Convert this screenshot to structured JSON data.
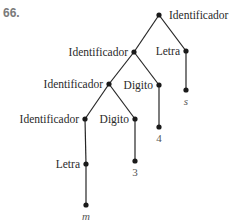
{
  "exercise_number": "66.",
  "tree": {
    "nodes": [
      {
        "id": "n0",
        "label": "Identificador",
        "x": 159,
        "y": 15,
        "label_side": "right"
      },
      {
        "id": "n1",
        "label": "Identificador",
        "x": 134,
        "y": 52,
        "label_side": "left"
      },
      {
        "id": "n2",
        "label": "Letra",
        "x": 186,
        "y": 51,
        "label_side": "left"
      },
      {
        "id": "n3",
        "label": "s",
        "x": 186,
        "y": 90,
        "label_side": "below",
        "leaf": true,
        "italic": true
      },
      {
        "id": "n4",
        "label": "Identificador",
        "x": 109,
        "y": 84,
        "label_side": "left"
      },
      {
        "id": "n5",
        "label": "Digito",
        "x": 159,
        "y": 85,
        "label_side": "left"
      },
      {
        "id": "n6",
        "label": "4",
        "x": 159,
        "y": 127,
        "label_side": "below",
        "leaf": true
      },
      {
        "id": "n7",
        "label": "Identificador",
        "x": 85,
        "y": 119,
        "label_side": "left"
      },
      {
        "id": "n8",
        "label": "Digito",
        "x": 135,
        "y": 119,
        "label_side": "left"
      },
      {
        "id": "n9",
        "label": "3",
        "x": 135,
        "y": 161,
        "label_side": "below",
        "leaf": true
      },
      {
        "id": "n10",
        "label": "Letra",
        "x": 86,
        "y": 164,
        "label_side": "left"
      },
      {
        "id": "n11",
        "label": "m",
        "x": 86,
        "y": 205,
        "label_side": "below",
        "leaf": true,
        "italic": true
      }
    ],
    "edges": [
      [
        "n0",
        "n1"
      ],
      [
        "n0",
        "n2"
      ],
      [
        "n2",
        "n3"
      ],
      [
        "n1",
        "n4"
      ],
      [
        "n1",
        "n5"
      ],
      [
        "n5",
        "n6"
      ],
      [
        "n4",
        "n7"
      ],
      [
        "n4",
        "n8"
      ],
      [
        "n8",
        "n9"
      ],
      [
        "n7",
        "n10"
      ],
      [
        "n10",
        "n11"
      ]
    ]
  }
}
